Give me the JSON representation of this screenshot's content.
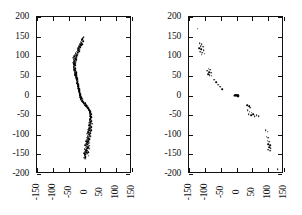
{
  "chart_data": [
    {
      "type": "scatter",
      "panel": "left",
      "title": "",
      "xlabel": "",
      "ylabel": "",
      "xlim": [
        -150,
        150
      ],
      "ylim": [
        -200,
        200
      ],
      "xticks": [
        -150,
        -100,
        -50,
        0,
        50,
        100,
        150
      ],
      "yticks": [
        -200,
        -150,
        -100,
        -50,
        0,
        50,
        100,
        150,
        200
      ],
      "xticklabels": [
        "-150",
        "-100",
        "-50",
        "0",
        "50",
        "100",
        "150"
      ],
      "yticklabels": [
        "-200",
        "-150",
        "-100",
        "-50",
        "0",
        "50",
        "100",
        "150",
        "200"
      ],
      "grid": false,
      "legend": false,
      "marker_color": "#000000",
      "points": [
        [
          -3,
          149
        ],
        [
          -6,
          146
        ],
        [
          -9,
          141
        ],
        [
          -12,
          137
        ],
        [
          -9,
          134
        ],
        [
          -14,
          131
        ],
        [
          -11,
          128
        ],
        [
          -16,
          126
        ],
        [
          -13,
          123
        ],
        [
          -18,
          121
        ],
        [
          -15,
          118
        ],
        [
          -20,
          116
        ],
        [
          -17,
          113
        ],
        [
          -22,
          111
        ],
        [
          -19,
          109
        ],
        [
          -24,
          107
        ],
        [
          -21,
          105
        ],
        [
          -26,
          103
        ],
        [
          -23,
          101
        ],
        [
          -27,
          99
        ],
        [
          -24,
          97
        ],
        [
          -29,
          95
        ],
        [
          -26,
          93
        ],
        [
          -30,
          91
        ],
        [
          -27,
          89
        ],
        [
          -31,
          87
        ],
        [
          -28,
          85
        ],
        [
          -32,
          83
        ],
        [
          -29,
          81
        ],
        [
          -33,
          79
        ],
        [
          -30,
          77
        ],
        [
          -34,
          75
        ],
        [
          -31,
          73
        ],
        [
          -34,
          71
        ],
        [
          -30,
          69
        ],
        [
          -33,
          67
        ],
        [
          -29,
          65
        ],
        [
          -32,
          63
        ],
        [
          -28,
          61
        ],
        [
          -31,
          59
        ],
        [
          -27,
          57
        ],
        [
          -30,
          55
        ],
        [
          -26,
          53
        ],
        [
          -29,
          51
        ],
        [
          -25,
          49
        ],
        [
          -27,
          47
        ],
        [
          -24,
          45
        ],
        [
          -26,
          43
        ],
        [
          -23,
          41
        ],
        [
          -25,
          39
        ],
        [
          -22,
          37
        ],
        [
          -24,
          35
        ],
        [
          -21,
          33
        ],
        [
          -23,
          31
        ],
        [
          -20,
          29
        ],
        [
          -21,
          27
        ],
        [
          -19,
          25
        ],
        [
          -20,
          23
        ],
        [
          -18,
          21
        ],
        [
          -19,
          19
        ],
        [
          -17,
          17
        ],
        [
          -18,
          15
        ],
        [
          -16,
          13
        ],
        [
          -17,
          11
        ],
        [
          -15,
          9
        ],
        [
          -16,
          7
        ],
        [
          -14,
          5
        ],
        [
          -15,
          3
        ],
        [
          -13,
          1
        ],
        [
          -14,
          -1
        ],
        [
          -12,
          -3
        ],
        [
          -13,
          -5
        ],
        [
          -11,
          -7
        ],
        [
          -12,
          -9
        ],
        [
          -10,
          -11
        ],
        [
          -9,
          -13
        ],
        [
          -7,
          -15
        ],
        [
          -5,
          -17
        ],
        [
          -3,
          -19
        ],
        [
          -1,
          -21
        ],
        [
          1,
          -23
        ],
        [
          3,
          -25
        ],
        [
          5,
          -27
        ],
        [
          7,
          -29
        ],
        [
          9,
          -31
        ],
        [
          11,
          -33
        ],
        [
          13,
          -35
        ],
        [
          14,
          -37
        ],
        [
          16,
          -39
        ],
        [
          17,
          -41
        ],
        [
          18,
          -43
        ],
        [
          16,
          -45
        ],
        [
          19,
          -47
        ],
        [
          17,
          -49
        ],
        [
          20,
          -51
        ],
        [
          18,
          -53
        ],
        [
          21,
          -55
        ],
        [
          19,
          -57
        ],
        [
          16,
          -59
        ],
        [
          20,
          -61
        ],
        [
          17,
          -63
        ],
        [
          21,
          -65
        ],
        [
          18,
          -67
        ],
        [
          15,
          -69
        ],
        [
          19,
          -71
        ],
        [
          16,
          -73
        ],
        [
          20,
          -75
        ],
        [
          13,
          -77
        ],
        [
          17,
          -79
        ],
        [
          21,
          -81
        ],
        [
          14,
          -83
        ],
        [
          18,
          -85
        ],
        [
          11,
          -87
        ],
        [
          15,
          -89
        ],
        [
          19,
          -91
        ],
        [
          12,
          -93
        ],
        [
          16,
          -95
        ],
        [
          9,
          -97
        ],
        [
          13,
          -99
        ],
        [
          17,
          -101
        ],
        [
          10,
          -103
        ],
        [
          14,
          -105
        ],
        [
          7,
          -107
        ],
        [
          11,
          -109
        ],
        [
          15,
          -111
        ],
        [
          8,
          -113
        ],
        [
          12,
          -115
        ],
        [
          5,
          -117
        ],
        [
          9,
          -119
        ],
        [
          13,
          -121
        ],
        [
          6,
          -123
        ],
        [
          10,
          -125
        ],
        [
          3,
          -127
        ],
        [
          7,
          -129
        ],
        [
          11,
          -131
        ],
        [
          4,
          -133
        ],
        [
          8,
          -135
        ],
        [
          1,
          -137
        ],
        [
          5,
          -139
        ],
        [
          9,
          -141
        ],
        [
          2,
          -143
        ],
        [
          6,
          -145
        ],
        [
          -1,
          -147
        ],
        [
          3,
          -149
        ],
        [
          0,
          -152
        ],
        [
          4,
          -155
        ],
        [
          -2,
          -158
        ],
        [
          2,
          -161
        ],
        [
          -8,
          143
        ],
        [
          -5,
          139
        ],
        [
          -10,
          135
        ],
        [
          -7,
          130
        ],
        [
          -12,
          127
        ],
        [
          -15,
          124
        ],
        [
          -19,
          120
        ],
        [
          -22,
          117
        ],
        [
          -25,
          112
        ],
        [
          -28,
          108
        ],
        [
          -31,
          104
        ],
        [
          -33,
          100
        ],
        [
          -35,
          96
        ],
        [
          -34,
          92
        ],
        [
          -32,
          88
        ],
        [
          -35,
          84
        ],
        [
          -33,
          80
        ],
        [
          -31,
          76
        ],
        [
          -34,
          72
        ],
        [
          -28,
          68
        ],
        [
          -31,
          64
        ],
        [
          -27,
          60
        ],
        [
          -29,
          56
        ],
        [
          -25,
          52
        ],
        [
          -27,
          48
        ],
        [
          -23,
          44
        ],
        [
          -25,
          40
        ],
        [
          -22,
          36
        ],
        [
          -23,
          32
        ],
        [
          -20,
          28
        ],
        [
          -19,
          24
        ],
        [
          -18,
          20
        ],
        [
          -17,
          16
        ],
        [
          -16,
          12
        ],
        [
          -15,
          8
        ],
        [
          -14,
          4
        ],
        [
          -13,
          0
        ],
        [
          -11,
          -4
        ],
        [
          -8,
          -8
        ],
        [
          -6,
          -12
        ],
        [
          -2,
          -16
        ],
        [
          2,
          -20
        ],
        [
          6,
          -24
        ],
        [
          10,
          -28
        ],
        [
          12,
          -32
        ],
        [
          15,
          -36
        ],
        [
          18,
          -40
        ],
        [
          20,
          -44
        ],
        [
          22,
          -48
        ],
        [
          19,
          -52
        ],
        [
          22,
          -56
        ],
        [
          18,
          -60
        ],
        [
          23,
          -64
        ],
        [
          19,
          -68
        ],
        [
          24,
          -72
        ],
        [
          14,
          -76
        ],
        [
          22,
          -80
        ],
        [
          16,
          -84
        ],
        [
          21,
          -88
        ],
        [
          12,
          -92
        ],
        [
          18,
          -96
        ],
        [
          14,
          -100
        ],
        [
          19,
          -104
        ],
        [
          10,
          -108
        ],
        [
          16,
          -112
        ],
        [
          12,
          -116
        ],
        [
          17,
          -120
        ],
        [
          8,
          -124
        ],
        [
          14,
          -128
        ],
        [
          10,
          -132
        ],
        [
          15,
          -136
        ],
        [
          6,
          -140
        ],
        [
          12,
          -144
        ],
        [
          8,
          -148
        ],
        [
          13,
          -153
        ],
        [
          3,
          -157
        ]
      ]
    },
    {
      "type": "scatter",
      "panel": "right",
      "title": "",
      "xlabel": "",
      "ylabel": "",
      "xlim": [
        -150,
        150
      ],
      "ylim": [
        -200,
        200
      ],
      "xticks": [
        -150,
        -100,
        -50,
        0,
        50,
        100,
        150
      ],
      "yticks": [
        -200,
        -150,
        -100,
        -50,
        0,
        50,
        100,
        150,
        200
      ],
      "xticklabels": [
        "-150",
        "-100",
        "-50",
        "0",
        "50",
        "100",
        "150"
      ],
      "yticklabels": [
        "-200",
        "-150",
        "-100",
        "-50",
        "0",
        "50",
        "100",
        "150",
        "200"
      ],
      "grid": false,
      "legend": false,
      "marker_color": "#000000",
      "points": [
        [
          -122,
          170
        ],
        [
          -116,
          133
        ],
        [
          -110,
          130
        ],
        [
          -113,
          126
        ],
        [
          -106,
          124
        ],
        [
          -118,
          121
        ],
        [
          -111,
          118
        ],
        [
          -104,
          116
        ],
        [
          -114,
          112
        ],
        [
          -108,
          109
        ],
        [
          -101,
          107
        ],
        [
          -110,
          104
        ],
        [
          -88,
          68
        ],
        [
          -83,
          66
        ],
        [
          -92,
          63
        ],
        [
          -86,
          60
        ],
        [
          -80,
          58
        ],
        [
          -90,
          55
        ],
        [
          -84,
          52
        ],
        [
          -78,
          50
        ],
        [
          -70,
          40
        ],
        [
          -64,
          34
        ],
        [
          -58,
          28
        ],
        [
          -52,
          22
        ],
        [
          -46,
          16
        ],
        [
          -6,
          2
        ],
        [
          -4,
          1
        ],
        [
          -2,
          1
        ],
        [
          0,
          0
        ],
        [
          1,
          0
        ],
        [
          2,
          -1
        ],
        [
          3,
          -1
        ],
        [
          4,
          -2
        ],
        [
          -5,
          0
        ],
        [
          -3,
          -1
        ],
        [
          5,
          1
        ],
        [
          6,
          -2
        ],
        [
          -1,
          2
        ],
        [
          2,
          2
        ],
        [
          -7,
          -1
        ],
        [
          7,
          0
        ],
        [
          34,
          -24
        ],
        [
          40,
          -28
        ],
        [
          44,
          -31
        ],
        [
          36,
          -38
        ],
        [
          42,
          -41
        ],
        [
          48,
          -44
        ],
        [
          38,
          -48
        ],
        [
          46,
          -50
        ],
        [
          52,
          -47
        ],
        [
          58,
          -52
        ],
        [
          64,
          -50
        ],
        [
          70,
          -53
        ],
        [
          92,
          -88
        ],
        [
          98,
          -92
        ],
        [
          95,
          -105
        ],
        [
          101,
          -108
        ],
        [
          98,
          -115
        ],
        [
          104,
          -118
        ],
        [
          100,
          -124
        ],
        [
          106,
          -127
        ],
        [
          103,
          -131
        ],
        [
          108,
          -134
        ],
        [
          101,
          -138
        ],
        [
          107,
          -141
        ],
        [
          130,
          -188
        ]
      ]
    }
  ]
}
